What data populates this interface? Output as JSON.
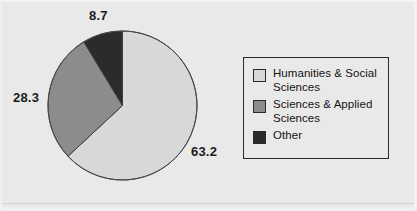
{
  "figure": {
    "background_color": "#e9e9e9",
    "border_color": "#2a2a2a"
  },
  "labels": {
    "other": "8.7",
    "sciences": "28.3",
    "humanities": "63.2"
  },
  "legend": {
    "items": [
      {
        "label": "Humanities & Social Sciences",
        "color": "#d8d8d8",
        "swatch_name": "legend-swatch-humanities"
      },
      {
        "label": "Sciences & Applied Sciences",
        "color": "#8c8c8c",
        "swatch_name": "legend-swatch-sciences"
      },
      {
        "label": "Other",
        "color": "#2b2b2b",
        "swatch_name": "legend-swatch-other"
      }
    ]
  },
  "chart_data": {
    "type": "pie",
    "title": "",
    "subtitle": "",
    "xlabel": "",
    "ylabel": "",
    "grid": false,
    "legend_position": "right",
    "start_angle_deg": 0,
    "direction": "clockwise",
    "units": "percent",
    "total": 100.2,
    "categories": [
      "Humanities & Social Sciences",
      "Sciences & Applied Sciences",
      "Other"
    ],
    "values": [
      63.2,
      28.3,
      8.7
    ],
    "colors": [
      "#d8d8d8",
      "#8c8c8c",
      "#2b2b2b"
    ],
    "data_labels": [
      "63.2",
      "28.3",
      "8.7"
    ],
    "slices": [
      {
        "label": "Humanities & Social Sciences",
        "value": 63.2,
        "color": "#d8d8d8",
        "start_deg": 0.0,
        "end_deg": 227.52
      },
      {
        "label": "Sciences & Applied Sciences",
        "value": 28.3,
        "color": "#8c8c8c",
        "start_deg": 227.52,
        "end_deg": 329.4
      },
      {
        "label": "Other",
        "value": 8.7,
        "color": "#2b2b2b",
        "start_deg": 329.4,
        "end_deg": 360.0
      }
    ]
  }
}
